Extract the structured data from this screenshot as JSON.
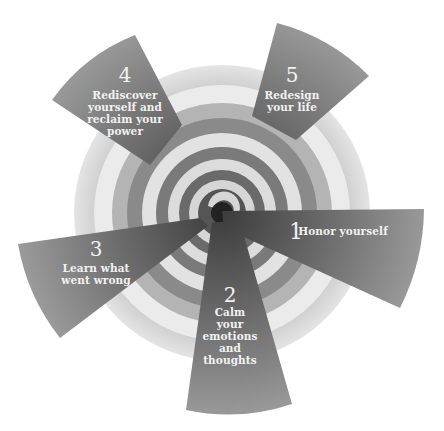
{
  "diagram": {
    "title": "",
    "colors": {
      "background": "#ffffff",
      "wedge_dark": "#5a5a5a",
      "wedge_light": "#9a9a9a",
      "ring_dark": "#6e6e6e",
      "ring_mid": "#a8a8a8",
      "ring_light": "#dadada",
      "center": "#222222",
      "label": "#f2f2f2"
    },
    "steps": [
      {
        "number": "1",
        "lines": [
          "Honor yourself"
        ]
      },
      {
        "number": "2",
        "lines": [
          "Calm",
          "your",
          "emotions",
          "and",
          "thoughts"
        ]
      },
      {
        "number": "3",
        "lines": [
          "Learn what",
          "went wrong"
        ]
      },
      {
        "number": "4",
        "lines": [
          "Rediscover",
          "yourself and",
          "reclaim your",
          "power"
        ]
      },
      {
        "number": "5",
        "lines": [
          "Redesign",
          "your life"
        ]
      }
    ]
  }
}
